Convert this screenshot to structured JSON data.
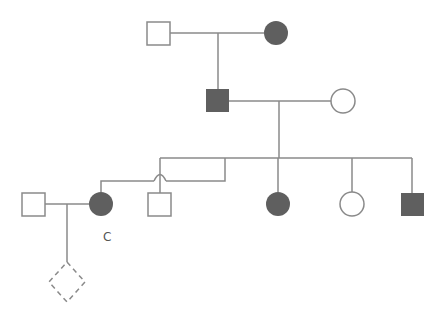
{
  "diagram": {
    "type": "pedigree",
    "colors": {
      "line": "#8a8a8a",
      "affected_fill": "#5f5f5f",
      "unaffected_fill": "#ffffff"
    },
    "labels": {
      "proband_label": "C"
    },
    "individuals": [
      {
        "id": "gen1-male",
        "sex": "male",
        "affected": false,
        "generation": 1
      },
      {
        "id": "gen1-female",
        "sex": "female",
        "affected": true,
        "generation": 1
      },
      {
        "id": "gen2-male",
        "sex": "male",
        "affected": true,
        "generation": 2
      },
      {
        "id": "gen2-female",
        "sex": "female",
        "affected": false,
        "generation": 2
      },
      {
        "id": "gen3-female-C",
        "sex": "female",
        "affected": true,
        "generation": 3,
        "label": "C"
      },
      {
        "id": "gen3-male-1",
        "sex": "male",
        "affected": false,
        "generation": 3
      },
      {
        "id": "gen3-female-2",
        "sex": "female",
        "affected": true,
        "generation": 3
      },
      {
        "id": "gen3-female-3",
        "sex": "female",
        "affected": false,
        "generation": 3
      },
      {
        "id": "gen3-male-4",
        "sex": "male",
        "affected": true,
        "generation": 3
      },
      {
        "id": "gen3-spouse-male",
        "sex": "male",
        "affected": false,
        "generation": 3
      },
      {
        "id": "gen4-unknown",
        "sex": "unknown",
        "affected": false,
        "generation": 4,
        "status": "pregnancy/unborn (dashed)"
      }
    ]
  }
}
